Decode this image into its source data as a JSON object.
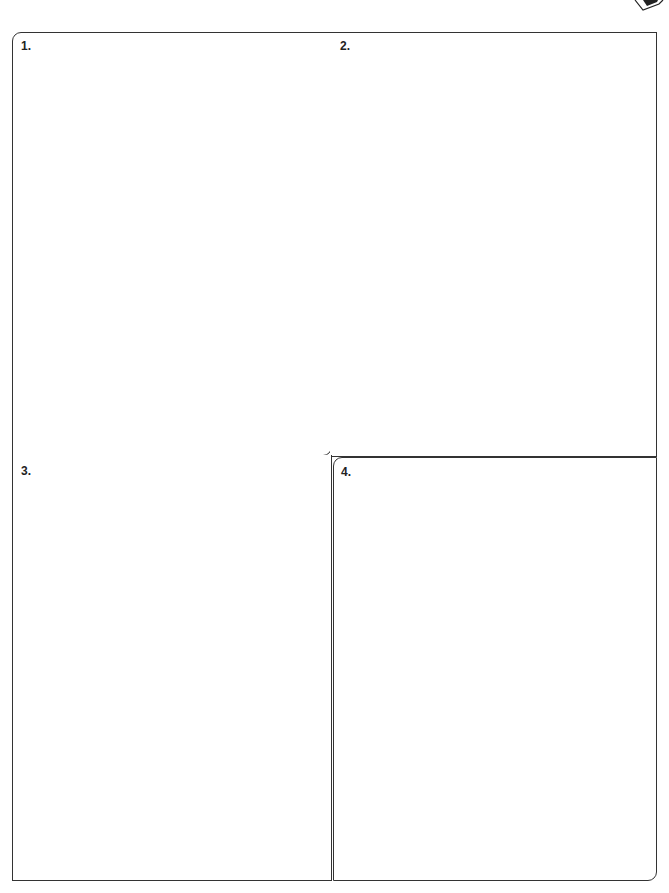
{
  "worksheet": {
    "panels": [
      {
        "label": "1."
      },
      {
        "label": "2."
      },
      {
        "label": "3."
      },
      {
        "label": "4."
      }
    ]
  }
}
